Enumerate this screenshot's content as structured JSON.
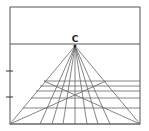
{
  "diagram": {
    "vanishing_point": {
      "label": "C",
      "x": 75,
      "y": 46
    },
    "frame": {
      "left": 10,
      "top": 7,
      "right": 140,
      "bottom": 124
    },
    "horizon_y": 44,
    "left_ticks_y": [
      71,
      97
    ],
    "rays_bottom_x": [
      10,
      40,
      63,
      87,
      110,
      140
    ],
    "horizontals": [
      {
        "y": 81,
        "x1": 44,
        "x2": 140
      },
      {
        "y": 86,
        "x1": 40,
        "x2": 140
      },
      {
        "y": 91,
        "x1": 36,
        "x2": 140
      },
      {
        "y": 98,
        "x1": 31,
        "x2": 140
      },
      {
        "y": 108,
        "x1": 23,
        "x2": 140
      }
    ],
    "diagonals": [
      {
        "x1": 44,
        "y1": 81,
        "x2": 140,
        "y2": 124
      },
      {
        "x1": 106,
        "y1": 81,
        "x2": 10,
        "y2": 124
      }
    ],
    "colors": {
      "line": "#666666",
      "frame": "#555555",
      "label": "#222222"
    }
  }
}
